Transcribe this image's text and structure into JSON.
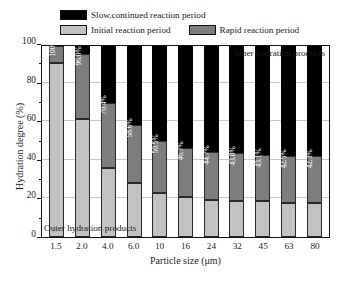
{
  "legend": {
    "items": [
      {
        "label": "Slow,continued reaction period",
        "color": "#000000",
        "key": "slow"
      },
      {
        "label": "Initial reaction period",
        "color": "#c2c2c2",
        "key": "initial"
      },
      {
        "label": "Rapid reaction period",
        "color": "#7d7d7d",
        "key": "rapid"
      }
    ]
  },
  "annotations": {
    "inner": "Inner hydration products",
    "outer": "Outer hydration products"
  },
  "axes": {
    "y_title": "Hydration degree (%)",
    "x_title": "Particle size (μm)",
    "y_ticks": [
      "0",
      "20",
      "40",
      "60",
      "80",
      "100"
    ]
  },
  "chart_data": {
    "type": "bar",
    "subtype": "stacked-bar",
    "title": "",
    "xlabel": "Particle size (μm)",
    "ylabel": "Hydration degree (%)",
    "ylim": [
      0,
      100
    ],
    "yticks": [
      0,
      20,
      40,
      60,
      80,
      100
    ],
    "grid": true,
    "legend_position": "top",
    "categories": [
      "1.5",
      "2.0",
      "4.0",
      "6.0",
      "10",
      "16",
      "24",
      "32",
      "45",
      "63",
      "80"
    ],
    "series": [
      {
        "name": "Initial reaction period",
        "color": "#c2c2c2",
        "values": [
          91.0,
          61.8,
          36.0,
          28.2,
          22.8,
          20.8,
          19.4,
          18.8,
          18.6,
          17.9,
          17.7
        ]
      },
      {
        "name": "Rapid reaction period",
        "color": "#7d7d7d",
        "values": [
          9.0,
          34.2,
          34.4,
          30.4,
          27.7,
          25.9,
          25.3,
          25.0,
          24.5,
          24.6,
          24.6
        ]
      },
      {
        "name": "Slow,continued reaction period",
        "color": "#000000",
        "values": [
          0.0,
          4.0,
          29.6,
          41.4,
          49.5,
          53.3,
          55.3,
          56.2,
          56.9,
          57.5,
          57.7
        ]
      }
    ],
    "bar_labels": [
      "100%",
      "96.0%",
      "70.4%",
      "58.6%",
      "50.5%",
      "46.7%",
      "44.7%",
      "43.8%",
      "43.1%",
      "42.5%",
      "42.3%"
    ],
    "bar_label_note": "Cumulative hydration degree at top of rapid reaction period segment",
    "annotations": [
      {
        "text": "Inner hydration products",
        "position": "top-right"
      },
      {
        "text": "Outer hydration products",
        "position": "bottom-left"
      }
    ]
  }
}
